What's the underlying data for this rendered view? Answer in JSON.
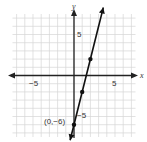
{
  "chart_data": {
    "type": "line",
    "title": "",
    "xlabel": "x",
    "ylabel": "y",
    "xlim": [
      -7.5,
      7.5
    ],
    "ylim": [
      -7.5,
      7.5
    ],
    "grid": true,
    "x_ticks_labeled": [
      -5,
      5
    ],
    "y_ticks_labeled": [
      5,
      -5
    ],
    "tick_labels": {
      "x_neg": "−5",
      "x_pos": "5",
      "y_pos": "5",
      "y_neg": "−5"
    },
    "series": [
      {
        "name": "y = 4x − 6",
        "equation": "y = 4x - 6",
        "slope": 4,
        "intercept": -6,
        "points": [
          {
            "x": 0,
            "y": -6
          },
          {
            "x": 1,
            "y": -2
          },
          {
            "x": 2,
            "y": 2
          }
        ]
      }
    ],
    "annotations": [
      {
        "text": "(0,−6)",
        "x": 0,
        "y": -6
      }
    ],
    "legend": null
  },
  "colors": {
    "grid": "#d6d6d6",
    "axis": "#222222",
    "line": "#111111",
    "background": "#ffffff"
  }
}
